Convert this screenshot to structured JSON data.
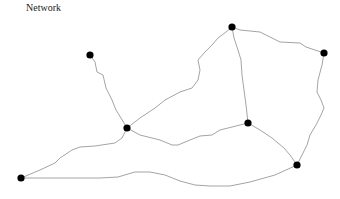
{
  "title": "Network",
  "colors": {
    "edge": "#9a9a9a",
    "node": "#000000",
    "background": "#ffffff"
  },
  "nodes": [
    {
      "id": "A"
    },
    {
      "id": "B"
    },
    {
      "id": "C"
    },
    {
      "id": "D"
    },
    {
      "id": "E"
    },
    {
      "id": "F"
    },
    {
      "id": "G"
    }
  ],
  "edges": [
    {
      "source": "A",
      "target": "B"
    },
    {
      "source": "B",
      "target": "C"
    },
    {
      "source": "B",
      "target": "G"
    },
    {
      "source": "B",
      "target": "E"
    },
    {
      "source": "C",
      "target": "D"
    },
    {
      "source": "C",
      "target": "E"
    },
    {
      "source": "D",
      "target": "F"
    },
    {
      "source": "E",
      "target": "F"
    },
    {
      "source": "G",
      "target": "F"
    }
  ]
}
